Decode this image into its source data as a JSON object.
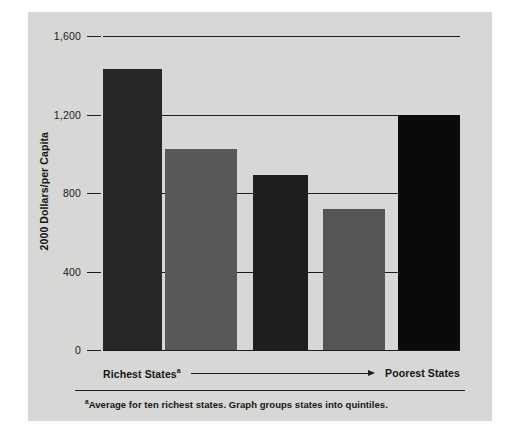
{
  "figure": {
    "background_color": "#d7d7d5",
    "page_background": "#ffffff"
  },
  "axis": {
    "y_title": "2000 Dollars/per Capita",
    "y_ticks": [
      "1,600",
      "1,200",
      "800",
      "400",
      "0"
    ],
    "x_left_label": "Richest States",
    "x_left_superscript": "a",
    "x_right_label": "Poorest States",
    "arrow_icon": "right-arrow-icon"
  },
  "footnote": {
    "marker": "a",
    "text": "Average for ten richest states. Graph groups states into quintiles."
  },
  "chart_data": {
    "type": "bar",
    "title": "",
    "xlabel": "",
    "ylabel": "2000 Dollars/per Capita",
    "ylim": [
      0,
      1600
    ],
    "yticks": [
      0,
      400,
      800,
      1200,
      1600
    ],
    "ytick_labels": [
      "0",
      "400",
      "800",
      "1,200",
      "1,600"
    ],
    "grid": true,
    "legend": false,
    "categories": [
      "Quintile 1 (Richest)",
      "Quintile 2",
      "Quintile 3",
      "Quintile 4",
      "Quintile 5 (Poorest)"
    ],
    "values": [
      1430,
      1025,
      890,
      720,
      1200
    ],
    "bar_colors": [
      "#262626",
      "#585858",
      "#1e1e1e",
      "#555555",
      "#0a0a0a"
    ],
    "bar_geometry": [
      {
        "left_pct": 0.0,
        "width_pct": 16.5
      },
      {
        "left_pct": 17.4,
        "width_pct": 20.2
      },
      {
        "left_pct": 42.0,
        "width_pct": 15.4
      },
      {
        "left_pct": 61.6,
        "width_pct": 17.4
      },
      {
        "left_pct": 82.6,
        "width_pct": 17.4
      }
    ]
  }
}
